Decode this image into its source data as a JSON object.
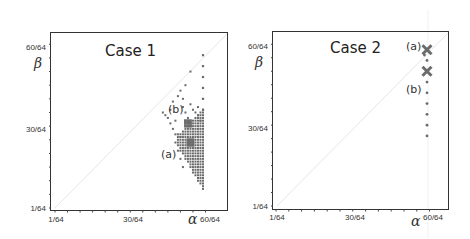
{
  "chart_data": [
    {
      "type": "scatter",
      "title": "Case 1",
      "xlabel": "α",
      "ylabel": "β",
      "x_ticks": [
        "1/64",
        "30/64",
        "60/64"
      ],
      "y_ticks": [
        "1/64",
        "30/64",
        "60/64"
      ],
      "xlim": [
        1,
        64
      ],
      "ylim": [
        1,
        64
      ],
      "unit": "1/64",
      "diagonal_reference_line": true,
      "annotations": [
        {
          "label": "(a)",
          "x": 55,
          "y": 24
        },
        {
          "label": "(b)",
          "x": 54,
          "y": 33
        }
      ],
      "isolated_points_alpha60": [
        57,
        53,
        49,
        45,
        41,
        37
      ],
      "dense_region": {
        "alpha_range": [
          50,
          60
        ],
        "beta_range": [
          8,
          40
        ],
        "shape": "triangular, widening toward alpha=60"
      },
      "highlight_clusters": [
        {
          "label": "(a)",
          "alpha": 55,
          "beta": 25
        },
        {
          "label": "(b)",
          "alpha": 54,
          "beta": 32
        }
      ]
    },
    {
      "type": "scatter",
      "title": "Case 2",
      "xlabel": "α",
      "ylabel": "β",
      "x_ticks": [
        "1/64",
        "30/64",
        "60/64"
      ],
      "y_ticks": [
        "1/64",
        "30/64",
        "60/64"
      ],
      "xlim": [
        1,
        64
      ],
      "ylim": [
        1,
        64
      ],
      "unit": "1/64",
      "diagonal_reference_line": true,
      "markers": [
        {
          "label": "(a)",
          "alpha": 60,
          "beta": 59,
          "marker": "x"
        },
        {
          "label": "(b)",
          "alpha": 60,
          "beta": 51,
          "marker": "x"
        }
      ],
      "points": [
        {
          "alpha": 59,
          "beta": 57
        },
        {
          "alpha": 60,
          "beta": 55
        },
        {
          "alpha": 60,
          "beta": 47
        },
        {
          "alpha": 60,
          "beta": 43
        },
        {
          "alpha": 60,
          "beta": 39
        },
        {
          "alpha": 60,
          "beta": 35
        },
        {
          "alpha": 60,
          "beta": 31
        },
        {
          "alpha": 60,
          "beta": 27
        }
      ]
    }
  ],
  "panels": {
    "left": {
      "title": "Case 1",
      "xlabel": "α",
      "ylabel": "β",
      "ann_a": "(a)",
      "ann_b": "(b)",
      "x_tick_1": "1/64",
      "x_tick_30": "30/64",
      "x_tick_60": "60/64",
      "y_tick_1": "1/64",
      "y_tick_30": "30/64",
      "y_tick_60": "60/64"
    },
    "right": {
      "title": "Case 2",
      "xlabel": "α",
      "ylabel": "β",
      "ann_a": "(a)",
      "ann_b": "(b)",
      "x_tick_1": "1/64",
      "x_tick_30": "30/64",
      "x_tick_60": "60/64",
      "y_tick_1": "1/64",
      "y_tick_30": "30/64",
      "y_tick_60": "60/64"
    }
  },
  "colors": {
    "points": "#6b6b6b",
    "frame": "#333333",
    "diagonal": "#e6e6e6"
  }
}
